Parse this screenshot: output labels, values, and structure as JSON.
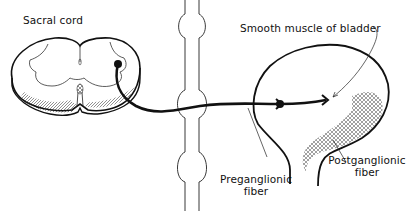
{
  "diagram": {
    "labels": {
      "sacral_cord": "Sacral cord",
      "smooth_muscle": "Smooth muscle of bladder",
      "preganglionic_line1": "Preganglionic",
      "preganglionic_line2": "fiber",
      "postganglionic_line1": "Postganglionic",
      "postganglionic_line2": "fiber"
    },
    "colors": {
      "ink": "#111111",
      "background": "#ffffff"
    }
  }
}
